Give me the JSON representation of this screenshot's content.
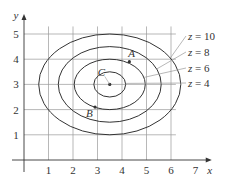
{
  "chart_data": {
    "type": "contour",
    "title": "",
    "xlabel": "x",
    "ylabel": "y",
    "x_ticks": [
      "1",
      "2",
      "3",
      "4",
      "5",
      "6",
      "7"
    ],
    "y_ticks": [
      "1",
      "2",
      "3",
      "4",
      "5"
    ],
    "xlim": [
      0,
      7.5
    ],
    "ylim": [
      0,
      5.5
    ],
    "grid": true,
    "grid_x_max": 6,
    "center": {
      "x": 3.5,
      "y": 3
    },
    "levels": [
      {
        "label": "z = 4",
        "z": 4,
        "rx": 0.65,
        "ry": 0.5
      },
      {
        "label": "z = 6",
        "z": 6,
        "rx": 1.45,
        "ry": 1.0
      },
      {
        "label": "z = 8",
        "z": 8,
        "rx": 2.1,
        "ry": 1.5
      },
      {
        "label": "z = 10",
        "z": 10,
        "rx": 2.9,
        "ry": 2.0
      }
    ],
    "points": [
      {
        "label": "A",
        "x": 4.3,
        "y": 3.9
      },
      {
        "label": "B",
        "x": 2.9,
        "y": 2.1
      },
      {
        "label": "C",
        "x": 3.5,
        "y": 3.0
      }
    ],
    "colors": {
      "curve": "#333333",
      "grid": "#999999",
      "axis": "#333333"
    }
  }
}
